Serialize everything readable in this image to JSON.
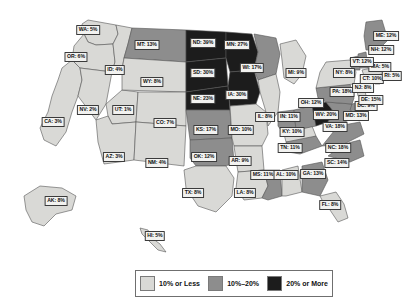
{
  "chart_data": {
    "type": "map",
    "title": "",
    "map_region": "United States",
    "value_unit": "%",
    "legend": {
      "position": "bottom-center",
      "bins": [
        {
          "label": "10% or Less",
          "color": "#d9d9d6",
          "max": 10
        },
        {
          "label": "10%–20%",
          "color": "#8d8d8d",
          "min": 10,
          "max": 20
        },
        {
          "label": "20% or More",
          "color": "#1c1c1c",
          "min": 20
        }
      ]
    },
    "states": [
      {
        "code": "WA",
        "value": 5,
        "label": "WA: 5%",
        "bin": 0,
        "lx": 88,
        "ly": 30
      },
      {
        "code": "OR",
        "value": 6,
        "label": "OR: 6%",
        "bin": 0,
        "lx": 76,
        "ly": 57
      },
      {
        "code": "CA",
        "value": 3,
        "label": "CA: 3%",
        "bin": 0,
        "lx": 53,
        "ly": 122
      },
      {
        "code": "ID",
        "value": 4,
        "label": "ID: 4%",
        "bin": 0,
        "lx": 115,
        "ly": 70
      },
      {
        "code": "NV",
        "value": 2,
        "label": "NV: 2%",
        "bin": 0,
        "lx": 88,
        "ly": 110
      },
      {
        "code": "UT",
        "value": 1,
        "label": "UT: 1%",
        "bin": 0,
        "lx": 123,
        "ly": 110
      },
      {
        "code": "AZ",
        "value": 3,
        "label": "AZ: 3%",
        "bin": 0,
        "lx": 114,
        "ly": 157
      },
      {
        "code": "MT",
        "value": 13,
        "label": "MT: 13%",
        "bin": 1,
        "lx": 147,
        "ly": 45
      },
      {
        "code": "WY",
        "value": 8,
        "label": "WY: 8%",
        "bin": 0,
        "lx": 152,
        "ly": 82
      },
      {
        "code": "CO",
        "value": 7,
        "label": "CO: 7%",
        "bin": 0,
        "lx": 165,
        "ly": 123
      },
      {
        "code": "NM",
        "value": 4,
        "label": "NM: 4%",
        "bin": 0,
        "lx": 157,
        "ly": 163
      },
      {
        "code": "ND",
        "value": 39,
        "label": "ND: 39%",
        "bin": 2,
        "lx": 203,
        "ly": 43
      },
      {
        "code": "SD",
        "value": 30,
        "label": "SD: 30%",
        "bin": 2,
        "lx": 203,
        "ly": 73
      },
      {
        "code": "NE",
        "value": 23,
        "label": "NE: 23%",
        "bin": 2,
        "lx": 203,
        "ly": 99
      },
      {
        "code": "KS",
        "value": 17,
        "label": "KS: 17%",
        "bin": 1,
        "lx": 206,
        "ly": 130
      },
      {
        "code": "OK",
        "value": 12,
        "label": "OK: 12%",
        "bin": 1,
        "lx": 204,
        "ly": 157
      },
      {
        "code": "TX",
        "value": 8,
        "label": "TX: 8%",
        "bin": 0,
        "lx": 193,
        "ly": 193
      },
      {
        "code": "MN",
        "value": 27,
        "label": "MN: 27%",
        "bin": 2,
        "lx": 237,
        "ly": 45
      },
      {
        "code": "IA",
        "value": 30,
        "label": "IA: 30%",
        "bin": 2,
        "lx": 237,
        "ly": 95
      },
      {
        "code": "MO",
        "value": 10,
        "label": "MO: 10%",
        "bin": 0,
        "lx": 241,
        "ly": 130
      },
      {
        "code": "AR",
        "value": 9,
        "label": "AR: 9%",
        "bin": 0,
        "lx": 240,
        "ly": 161
      },
      {
        "code": "LA",
        "value": 8,
        "label": "LA: 8%",
        "bin": 0,
        "lx": 245,
        "ly": 193
      },
      {
        "code": "WI",
        "value": 17,
        "label": "WI: 17%",
        "bin": 1,
        "lx": 252,
        "ly": 68
      },
      {
        "code": "IL",
        "value": 8,
        "label": "IL: 8%",
        "bin": 0,
        "lx": 265,
        "ly": 117
      },
      {
        "code": "MS",
        "value": 11,
        "label": "MS: 11%",
        "bin": 1,
        "lx": 263,
        "ly": 175
      },
      {
        "code": "MI",
        "value": 9,
        "label": "MI: 9%",
        "bin": 0,
        "lx": 296,
        "ly": 73
      },
      {
        "code": "IN",
        "value": 11,
        "label": "IN: 11%",
        "bin": 1,
        "lx": 289,
        "ly": 117
      },
      {
        "code": "KY",
        "value": 10,
        "label": "KY: 10%",
        "bin": 0,
        "lx": 292,
        "ly": 132
      },
      {
        "code": "TN",
        "value": 11,
        "label": "TN: 11%",
        "bin": 1,
        "lx": 290,
        "ly": 148
      },
      {
        "code": "AL",
        "value": 10,
        "label": "AL: 10%",
        "bin": 0,
        "lx": 286,
        "ly": 175
      },
      {
        "code": "OH",
        "value": 12,
        "label": "OH: 12%",
        "bin": 1,
        "lx": 311,
        "ly": 103
      },
      {
        "code": "GA",
        "value": 13,
        "label": "GA: 13%",
        "bin": 1,
        "lx": 313,
        "ly": 174
      },
      {
        "code": "FL",
        "value": 8,
        "label": "FL: 8%",
        "bin": 0,
        "lx": 330,
        "ly": 205
      },
      {
        "code": "WV",
        "value": 20,
        "label": "WV: 20%",
        "bin": 2,
        "lx": 326,
        "ly": 115
      },
      {
        "code": "VA",
        "value": 18,
        "label": "VA: 18%",
        "bin": 1,
        "lx": 335,
        "ly": 127
      },
      {
        "code": "NC",
        "value": 18,
        "label": "NC: 18%",
        "bin": 1,
        "lx": 338,
        "ly": 148
      },
      {
        "code": "SC",
        "value": 14,
        "label": "SC: 14%",
        "bin": 1,
        "lx": 337,
        "ly": 163
      },
      {
        "code": "PA",
        "value": 18,
        "label": "PA: 18%",
        "bin": 1,
        "lx": 342,
        "ly": 92
      },
      {
        "code": "MD",
        "value": 13,
        "label": "MD: 13%",
        "bin": 1,
        "lx": 356,
        "ly": 116
      },
      {
        "code": "DC",
        "value": 9,
        "label": "DC: 9%",
        "bin": 0,
        "lx": 366,
        "ly": 106
      },
      {
        "code": "DE",
        "value": 15,
        "label": "DE: 15%",
        "bin": 1,
        "lx": 371,
        "ly": 100
      },
      {
        "code": "NJ",
        "value": 8,
        "label": "NJ: 8%",
        "bin": 0,
        "lx": 363,
        "ly": 88
      },
      {
        "code": "NY",
        "value": 8,
        "label": "NY: 8%",
        "bin": 0,
        "lx": 344,
        "ly": 73
      },
      {
        "code": "CT",
        "value": 10,
        "label": "CT: 10%",
        "bin": 0,
        "lx": 372,
        "ly": 79
      },
      {
        "code": "RI",
        "value": 5,
        "label": "RI: 5%",
        "bin": 0,
        "lx": 392,
        "ly": 76
      },
      {
        "code": "MA",
        "value": 5,
        "label": "MA: 5%",
        "bin": 0,
        "lx": 380,
        "ly": 67
      },
      {
        "code": "VT",
        "value": 12,
        "label": "VT: 12%",
        "bin": 1,
        "lx": 362,
        "ly": 62
      },
      {
        "code": "NH",
        "value": 12,
        "label": "NH: 12%",
        "bin": 1,
        "lx": 381,
        "ly": 50
      },
      {
        "code": "ME",
        "value": 12,
        "label": "ME: 12%",
        "bin": 1,
        "lx": 386,
        "ly": 36
      },
      {
        "code": "AK",
        "value": 8,
        "label": "AK: 8%",
        "bin": 0,
        "lx": 56,
        "ly": 201
      },
      {
        "code": "HI",
        "value": 5,
        "label": "HI: 5%",
        "bin": 0,
        "lx": 155,
        "ly": 236
      }
    ]
  }
}
